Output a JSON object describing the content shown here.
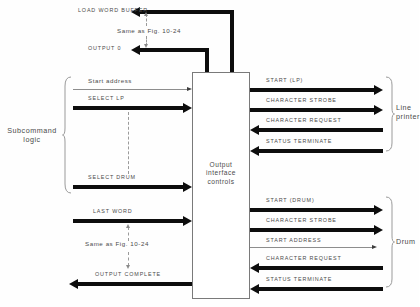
{
  "diagram": {
    "center_block": {
      "label_line1": "Output",
      "label_line2": "interface",
      "label_line3": "controls"
    },
    "top_signals": [
      {
        "name": "load-word-buffer",
        "label": "LOAD WORD BUFFER",
        "direction": "left",
        "style": "thick"
      },
      {
        "name": "output-0",
        "label": "OUTPUT 0",
        "direction": "left",
        "style": "thick"
      }
    ],
    "top_note": "Same as Fig. 10-24",
    "left_group": {
      "brace_label_line1": "Subcommand",
      "brace_label_line2": "logic",
      "signals": [
        {
          "name": "start-address",
          "label": "Start address",
          "direction": "right",
          "style": "thin"
        },
        {
          "name": "select-lp",
          "label": "SELECT LP",
          "direction": "right",
          "style": "thick"
        },
        {
          "name": "select-drum",
          "label": "SELECT DRUM",
          "direction": "right",
          "style": "thick"
        }
      ]
    },
    "bottom_left": {
      "note": "Same as Fig. 10-24",
      "signals": [
        {
          "name": "last-word",
          "label": "LAST WORD",
          "direction": "right",
          "style": "thick"
        },
        {
          "name": "output-complete",
          "label": "OUTPUT COMPLETE",
          "direction": "left",
          "style": "thick"
        }
      ]
    },
    "right_groups": [
      {
        "name": "line-printer",
        "brace_label_line1": "Line",
        "brace_label_line2": "printer",
        "signals": [
          {
            "name": "start-lp",
            "label": "START (LP)",
            "direction": "right",
            "style": "thick"
          },
          {
            "name": "character-strobe-lp",
            "label": "CHARACTER STROBE",
            "direction": "right",
            "style": "thick"
          },
          {
            "name": "character-request-lp",
            "label": "CHARACTER REQUEST",
            "direction": "left",
            "style": "thick"
          },
          {
            "name": "status-terminate-lp",
            "label": "STATUS TERMINATE",
            "direction": "left",
            "style": "thick"
          }
        ]
      },
      {
        "name": "drum",
        "brace_label_line1": "Drum",
        "brace_label_line2": "",
        "signals": [
          {
            "name": "start-drum",
            "label": "START (DRUM)",
            "direction": "right",
            "style": "thick"
          },
          {
            "name": "character-strobe-drum",
            "label": "CHARACTER STROBE",
            "direction": "right",
            "style": "thick"
          },
          {
            "name": "start-address-drum",
            "label": "START ADDRESS",
            "direction": "right",
            "style": "thin"
          },
          {
            "name": "character-request-drum",
            "label": "CHARACTER REQUEST",
            "direction": "left",
            "style": "thick"
          },
          {
            "name": "status-terminate-drum",
            "label": "STATUS TERMINATE",
            "direction": "left",
            "style": "thick"
          }
        ]
      }
    ],
    "colors": {
      "signal": "#0d0d0d",
      "thin_signal": "#8d8d8d",
      "text": "#4a4a4a",
      "box_border": "#7a7a7a",
      "background": "#ffffff"
    }
  }
}
